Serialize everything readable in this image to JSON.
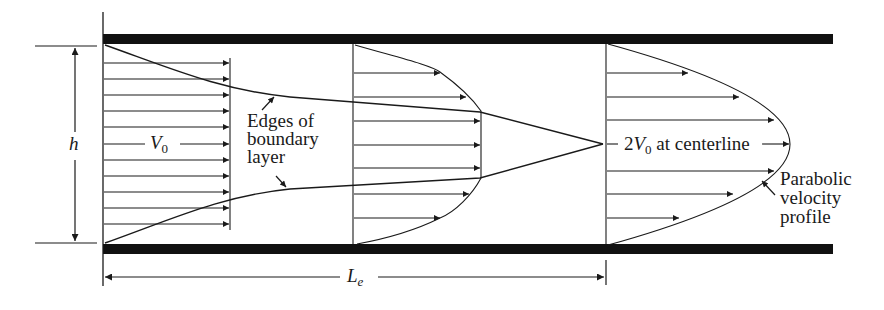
{
  "diagram": {
    "labels": {
      "height": "h",
      "inlet_velocity_base": "V",
      "inlet_velocity_sub": "0",
      "boundary_layer_line1": "Edges of",
      "boundary_layer_line2": "boundary",
      "boundary_layer_line3": "layer",
      "centerline_prefix": "2",
      "centerline_v": "V",
      "centerline_sub": "0",
      "centerline_suffix": " at centerline",
      "parabolic_line1": "Parabolic",
      "parabolic_line2": "velocity",
      "parabolic_line3": "profile",
      "entrance_length_base": "L",
      "entrance_length_sub": "e"
    },
    "colors": {
      "ink": "#1a1a1a",
      "wall": "#111111",
      "background": "#ffffff"
    },
    "profiles": [
      {
        "name": "uniform-inlet",
        "x": 103,
        "type": "uniform",
        "arrow_count": 11
      },
      {
        "name": "developing",
        "x": 353,
        "type": "developing",
        "arrow_count": 7
      },
      {
        "name": "fully-developed",
        "x": 606,
        "type": "parabolic",
        "arrow_count": 7
      }
    ]
  }
}
